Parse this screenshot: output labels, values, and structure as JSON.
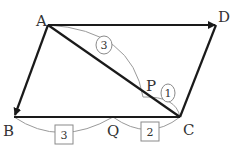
{
  "diagram": {
    "type": "parallelogram-vectors",
    "points": {
      "A": {
        "label": "A"
      },
      "B": {
        "label": "B"
      },
      "C": {
        "label": "C"
      },
      "D": {
        "label": "D"
      },
      "P": {
        "label": "P"
      },
      "Q": {
        "label": "Q"
      }
    },
    "vectors": [
      {
        "from": "A",
        "to": "D",
        "arrow": true
      },
      {
        "from": "A",
        "to": "B",
        "arrow": true
      },
      {
        "from": "B",
        "to": "C",
        "arrow": false
      },
      {
        "from": "C",
        "to": "D",
        "arrow": false
      },
      {
        "from": "A",
        "to": "C",
        "arrow": false
      }
    ],
    "ratios": {
      "AP_PC": {
        "AP": "3",
        "PC": "1",
        "marker": "circle"
      },
      "BQ_QC": {
        "BQ": "3",
        "QC": "2",
        "marker": "square"
      }
    }
  }
}
